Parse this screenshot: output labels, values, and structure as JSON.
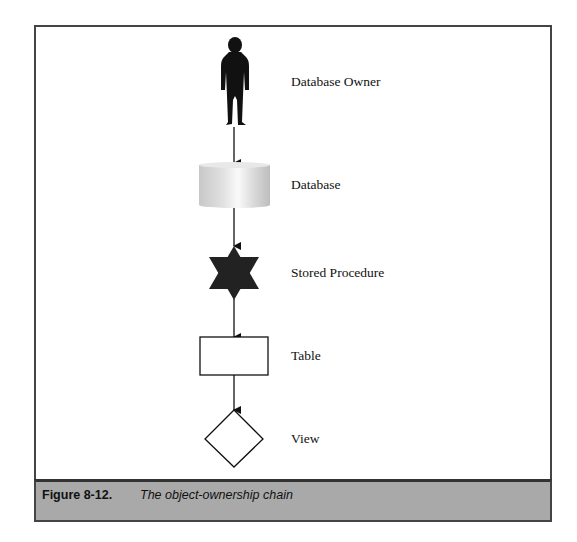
{
  "figure": {
    "number": "Figure 8-12.",
    "caption": "The object-ownership chain"
  },
  "diagram": {
    "type": "flow-chain",
    "direction": "top-to-bottom",
    "nodes": [
      {
        "id": "owner",
        "label": "Database Owner",
        "shape": "person-silhouette",
        "center_y": 82
      },
      {
        "id": "database",
        "label": "Database",
        "shape": "cylinder",
        "center_y": 185
      },
      {
        "id": "stored_procedure",
        "label": "Stored Procedure",
        "shape": "six-point-star",
        "center_y": 273
      },
      {
        "id": "table",
        "label": "Table",
        "shape": "rectangle",
        "center_y": 356
      },
      {
        "id": "view",
        "label": "View",
        "shape": "diamond",
        "center_y": 439
      }
    ],
    "edges": [
      {
        "from": "owner",
        "to": "database"
      },
      {
        "from": "database",
        "to": "stored_procedure"
      },
      {
        "from": "stored_procedure",
        "to": "table"
      },
      {
        "from": "table",
        "to": "view"
      }
    ]
  },
  "colors": {
    "caption_bar": "#a9a9a9",
    "frame_border": "#444444",
    "icon_fill": "#1a1a1a"
  }
}
